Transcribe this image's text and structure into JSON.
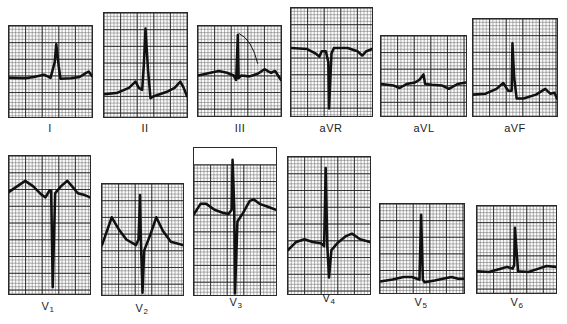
{
  "figure": {
    "grid": {
      "small_square_px": 3.4,
      "large_square_px": 17,
      "line_color": "#555555",
      "heavy_line_color": "#222222",
      "paper_color": "#fbfbfb",
      "trace_color": "#111111"
    },
    "rows": [
      {
        "name": "limb-leads",
        "leads": [
          {
            "id": "I",
            "label": "I",
            "sub": "",
            "box": [
              8,
              25,
              85,
              93
            ],
            "label_pos": [
              30,
              122
            ],
            "baseline": 0.57,
            "trace": "M0,0.57 L0.2,0.575 L0.3,0.56 L0.42,0.535 L0.46,0.55 L0.5,0.57 L0.55,0.4 L0.57,0.2 L0.6,0.45 L0.62,0.58 L0.75,0.575 L0.85,0.56 L0.92,0.52 L0.96,0.5 L1,0.55"
          },
          {
            "id": "II",
            "label": "II",
            "sub": "",
            "box": [
              103,
              12,
              85,
              106
            ],
            "label_pos": [
              125,
              122
            ],
            "baseline": 0.78,
            "trace": "M0,0.78 L0.15,0.77 L0.3,0.72 L0.38,0.66 L0.42,0.72 L0.46,0.74 L0.48,0.5 L0.5,0.15 L0.53,0.55 L0.56,0.82 L0.6,0.8 L0.75,0.76 L0.85,0.72 L0.92,0.66 L0.96,0.72 L1,0.8"
          },
          {
            "id": "III",
            "label": "III",
            "sub": "",
            "box": [
              197,
              25,
              85,
              92
            ],
            "label_pos": [
              220,
              122
            ],
            "baseline": 0.55,
            "trace": "M0,0.55 L0.15,0.52 L0.25,0.5 L0.35,0.52 L0.43,0.55 L0.46,0.6 L0.48,0.1 L0.49,0.58 L0.52,0.55 L0.62,0.56 L0.72,0.53 L0.8,0.48 L0.88,0.52 L0.93,0.5 L1,0.6",
            "annotation": "M0.49,0.08 Q0.65,0.15 0.72,0.42"
          },
          {
            "id": "aVR",
            "label": "aVR",
            "sub": "",
            "box": [
              290,
              7,
              83,
              110
            ],
            "label_pos": [
              311,
              122
            ],
            "baseline": 0.37,
            "trace": "M0,0.37 L0.2,0.38 L0.3,0.42 L0.35,0.45 L0.38,0.4 L0.43,0.4 L0.46,0.5 L0.47,0.93 L0.5,0.42 L0.53,0.37 L0.7,0.37 L0.82,0.4 L0.88,0.44 L0.93,0.4 L1,0.38"
          },
          {
            "id": "aVL",
            "label": "aVL",
            "sub": "",
            "box": [
              380,
              35,
              87,
              82
            ],
            "label_pos": [
              404,
              122
            ],
            "baseline": 0.6,
            "trace": "M0,0.6 L0.15,0.62 L0.22,0.65 L0.3,0.6 L0.4,0.58 L0.45,0.55 L0.5,0.48 L0.52,0.6 L0.6,0.61 L0.72,0.62 L0.8,0.66 L0.9,0.6 L1,0.58"
          },
          {
            "id": "aVF",
            "label": "aVF",
            "sub": "",
            "box": [
              472,
              18,
              86,
              99
            ],
            "label_pos": [
              495,
              122
            ],
            "baseline": 0.78,
            "trace": "M0,0.78 L0.15,0.77 L0.28,0.72 L0.36,0.66 L0.42,0.74 L0.46,0.74 L0.47,0.25 L0.49,0.6 L0.52,0.82 L0.6,0.82 L0.75,0.78 L0.86,0.72 L0.92,0.77 L0.97,0.76 L1,0.82"
          }
        ]
      },
      {
        "name": "precordial-leads",
        "leads": [
          {
            "id": "V1",
            "label": "V",
            "sub": "1",
            "box": [
              8,
              155,
              83,
              140
            ],
            "label_pos": [
              28,
              300
            ],
            "baseline": 0.26,
            "trace": "M0,0.26 L0.1,0.22 L0.2,0.18 L0.3,0.22 L0.4,0.28 L0.45,0.3 L0.5,0.25 L0.52,0.25 L0.54,0.95 L0.57,0.27 L0.64,0.22 L0.72,0.18 L0.78,0.22 L0.85,0.27 L0.92,0.28 L1,0.3"
          },
          {
            "id": "V2",
            "label": "V",
            "sub": "2",
            "box": [
              101,
              183,
              83,
              113
            ],
            "label_pos": [
              122,
              302
            ],
            "baseline": 0.5,
            "trace": "M0,0.55 L0.12,0.3 L0.2,0.4 L0.3,0.5 L0.42,0.55 L0.45,0.5 L0.47,0.1 L0.48,0.5 L0.5,0.98 L0.52,0.6 L0.6,0.45 L0.67,0.3 L0.75,0.42 L0.85,0.52 L1,0.55"
          },
          {
            "id": "V3",
            "label": "V",
            "sub": "3",
            "box": [
              193,
              147,
              84,
              149
            ],
            "label_pos": [
              216,
              296
            ],
            "blank_top_px": 17,
            "baseline": 0.42,
            "trace": "M0,0.45 L0.08,0.38 L0.15,0.38 L0.25,0.42 L0.35,0.44 L0.42,0.45 L0.46,0.42 L0.47,0.08 L0.49,0.4 L0.5,0.99 L0.53,0.5 L0.6,0.44 L0.68,0.36 L0.73,0.35 L0.8,0.38 L0.9,0.4 L1,0.42"
          },
          {
            "id": "V4",
            "label": "V",
            "sub": "4",
            "box": [
              287,
              156,
              84,
              139
            ],
            "label_pos": [
              309,
              292
            ],
            "baseline": 0.65,
            "trace": "M0,0.68 L0.1,0.62 L0.2,0.6 L0.3,0.62 L0.4,0.63 L0.44,0.65 L0.46,0.08 L0.48,0.65 L0.5,0.88 L0.53,0.68 L0.6,0.63 L0.7,0.58 L0.78,0.56 L0.88,0.6 L1,0.62"
          },
          {
            "id": "V5",
            "label": "V",
            "sub": "5",
            "box": [
              379,
              203,
              86,
              91
            ],
            "label_pos": [
              401,
              296
            ],
            "baseline": 0.85,
            "trace": "M0,0.87 L0.15,0.85 L0.28,0.82 L0.38,0.82 L0.44,0.84 L0.47,0.85 L0.49,0.12 L0.51,0.85 L0.53,0.88 L0.65,0.86 L0.75,0.84 L0.85,0.82 L0.93,0.84 L1,0.84"
          },
          {
            "id": "V6",
            "label": "V",
            "sub": "6",
            "box": [
              476,
              205,
              81,
              89
            ],
            "label_pos": [
              497,
              296
            ],
            "baseline": 0.74,
            "trace": "M0,0.75 L0.15,0.76 L0.3,0.72 L0.38,0.7 L0.45,0.72 L0.47,0.68 L0.48,0.25 L0.5,0.5 L0.52,0.75 L0.65,0.76 L0.78,0.72 L0.88,0.69 L1,0.7"
          }
        ]
      }
    ]
  }
}
